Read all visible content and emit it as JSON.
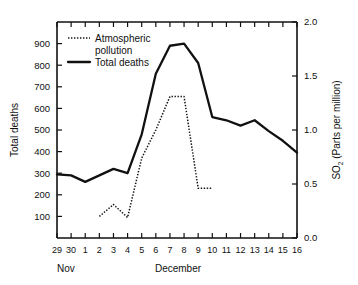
{
  "chart_data": {
    "type": "line",
    "title": "",
    "xlabel": "December",
    "x_axis_secondary_label": "Nov",
    "ylabel": "Total deaths",
    "y2label": "SO2 (Parts per million)",
    "y2label_main": "SO",
    "y2label_sub": "2",
    "y2label_rest": " (Parts per million)",
    "grid": false,
    "legend_position": "top-left",
    "x_tick_labels": [
      "29",
      "30",
      "1",
      "2",
      "3",
      "4",
      "5",
      "6",
      "7",
      "8",
      "9",
      "10",
      "11",
      "12",
      "13",
      "14",
      "15",
      "16"
    ],
    "x_values": [
      0,
      1,
      2,
      3,
      4,
      5,
      6,
      7,
      8,
      9,
      10,
      11,
      12,
      13,
      14,
      15,
      16,
      17
    ],
    "ylim": [
      0,
      1000
    ],
    "y_tick_labels": [
      "100",
      "200",
      "300",
      "400",
      "500",
      "600",
      "700",
      "800",
      "900"
    ],
    "y_tick_values": [
      100,
      200,
      300,
      400,
      500,
      600,
      700,
      800,
      900
    ],
    "y2lim": [
      0,
      2.0
    ],
    "y2_tick_labels": [
      "0.0",
      "0.5",
      "1.0",
      "1.5",
      "2.0"
    ],
    "y2_tick_values": [
      0.0,
      0.5,
      1.0,
      1.5,
      2.0
    ],
    "series": [
      {
        "name": "Total deaths",
        "style": "solid",
        "axis": "left",
        "x_labels": [
          "29",
          "30",
          "1",
          "2",
          "3",
          "4",
          "5",
          "6",
          "7",
          "8",
          "9",
          "10",
          "11",
          "12",
          "13",
          "14",
          "15",
          "16"
        ],
        "values": [
          295,
          290,
          260,
          290,
          320,
          300,
          480,
          760,
          890,
          900,
          810,
          560,
          545,
          520,
          545,
          495,
          450,
          395
        ]
      },
      {
        "name": "Atmospheric pollution",
        "style": "dotted",
        "axis": "right",
        "x_labels": [
          "2",
          "3",
          "4",
          "5",
          "6",
          "7",
          "8",
          "9",
          "10"
        ],
        "values_deaths_scale": [
          100,
          155,
          95,
          370,
          500,
          655,
          655,
          230,
          230
        ],
        "values_ppm": [
          0.2,
          0.31,
          0.19,
          0.74,
          1.0,
          1.31,
          1.31,
          0.46,
          0.46
        ]
      }
    ],
    "legend": [
      {
        "label": "Atmospheric pollution",
        "style": "dotted"
      },
      {
        "label": "Total deaths",
        "style": "solid"
      }
    ]
  }
}
